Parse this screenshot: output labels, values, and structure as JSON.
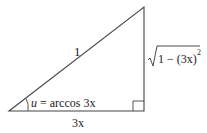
{
  "diagram": {
    "type": "right-triangle",
    "labels": {
      "hypotenuse": "1",
      "adjacent": "3x",
      "opposite_radicand": "1 − (3x)",
      "opposite_exponent": "2",
      "angle_var": "u",
      "angle_expr": " = arccos 3x"
    }
  }
}
